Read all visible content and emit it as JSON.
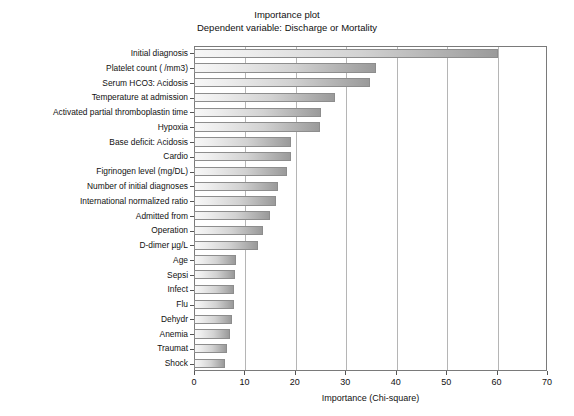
{
  "chart_data": {
    "type": "bar",
    "orientation": "horizontal",
    "title": "Importance plot",
    "subtitle": "Dependent variable: Discharge or Mortality",
    "xlabel": "Importance (Chi-square)",
    "ylabel": "",
    "xlim": [
      0,
      70
    ],
    "xticks": [
      0,
      10,
      20,
      30,
      40,
      50,
      60,
      70
    ],
    "xticklabels": [
      "0",
      "10",
      "20",
      "30",
      "40",
      "50",
      "60",
      "70"
    ],
    "grid": "vertical",
    "legend": "none",
    "categories": [
      "Initial diagnosis",
      "Platelet count ( /mm3)",
      "Serum HCO3: Acidosis",
      "Temperature at admission",
      "Activated partial thromboplastin time",
      "Hypoxia",
      "Base deficit: Acidosis",
      "Cardio",
      "Figrinogen level (mg/DL)",
      "Number of initial diagnoses",
      "International normalized ratio",
      "Admitted from",
      "Operation",
      "D-dimer µg/L",
      "Age",
      "Sepsi",
      "Infect",
      "Flu",
      "Dehydr",
      "Anemia",
      "Traumat",
      "Shock"
    ],
    "values": [
      60.2,
      36.1,
      34.9,
      28.0,
      25.2,
      25.0,
      19.2,
      19.2,
      18.5,
      16.6,
      16.3,
      15.0,
      13.7,
      12.6,
      8.4,
      8.1,
      8.0,
      7.9,
      7.6,
      7.1,
      6.6,
      6.2
    ],
    "bar_fill_light": "#f7f7f7",
    "bar_fill_dark": "#9a9a9a",
    "bar_border": "#8d8d8d",
    "gridline_color": "#b5b5b5",
    "frame_color": "#7a7a7a"
  }
}
